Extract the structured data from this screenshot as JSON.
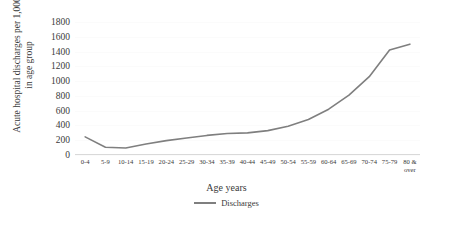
{
  "chart_data": {
    "type": "line",
    "title": "",
    "xlabel": "Age years",
    "ylabel": "Acute hospital discharges per 1,000 in age group",
    "ylabel_line1": "Acute hospital discharges per 1,000",
    "ylabel_line2": "in age group",
    "categories": [
      "0-4",
      "5-9",
      "10-14",
      "15-19",
      "20-24",
      "25-29",
      "30-34",
      "35-39",
      "40-44",
      "45-49",
      "50-54",
      "55-59",
      "60-64",
      "65-69",
      "70-74",
      "75-79",
      "80 &\nover"
    ],
    "series": [
      {
        "name": "Discharges",
        "color": "#7f7f7f",
        "values": [
          245,
          105,
          95,
          150,
          195,
          230,
          265,
          290,
          300,
          330,
          390,
          480,
          620,
          810,
          1060,
          1420,
          1500
        ]
      }
    ],
    "ylim": [
      0,
      1800
    ],
    "yticks": [
      0,
      200,
      400,
      600,
      800,
      1000,
      1200,
      1400,
      1600,
      1800
    ],
    "grid": true,
    "legend_position": "bottom"
  },
  "legend": {
    "entries": [
      {
        "label": "Discharges",
        "swatch": "line-swatch"
      }
    ]
  }
}
